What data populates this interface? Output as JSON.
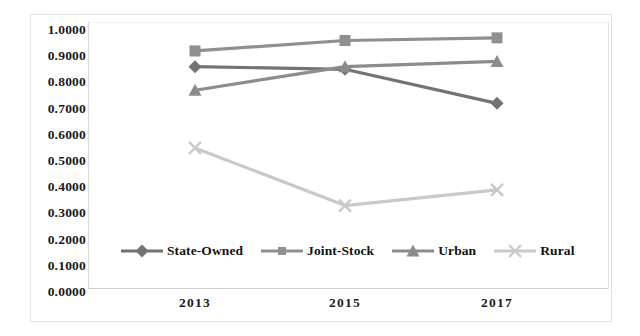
{
  "chart_data": {
    "type": "line",
    "title": "",
    "subtitle": "",
    "xlabel": "",
    "ylabel": "",
    "categories": [
      "2013",
      "2015",
      "2017"
    ],
    "x_tick_labels": [
      "2013",
      "2015",
      "2017"
    ],
    "y_tick_labels": [
      "1.0000",
      "0.9000",
      "0.8000",
      "0.7000",
      "0.6000",
      "0.5000",
      "0.4000",
      "0.3000",
      "0.2000",
      "0.1000",
      "0.0000"
    ],
    "y_tick_values": [
      1.0,
      0.9,
      0.8,
      0.7,
      0.6,
      0.5,
      0.4,
      0.3,
      0.2,
      0.1,
      0.0
    ],
    "ylim": [
      0.0,
      1.0
    ],
    "grid": false,
    "legend_position": "inside-bottom-left",
    "series": [
      {
        "name": "State-Owned",
        "marker": "diamond",
        "color": "#737373",
        "values": [
          0.86,
          0.85,
          0.72
        ]
      },
      {
        "name": "Joint-Stock",
        "marker": "square",
        "color": "#8f8f8f",
        "values": [
          0.92,
          0.96,
          0.97
        ]
      },
      {
        "name": "Urban",
        "marker": "triangle",
        "color": "#8c8c8c",
        "values": [
          0.77,
          0.86,
          0.88
        ]
      },
      {
        "name": "Rural",
        "marker": "cross",
        "color": "#c9c9c9",
        "values": [
          0.55,
          0.33,
          0.39
        ]
      }
    ]
  },
  "legend": {
    "items": [
      {
        "label": "State-Owned",
        "marker": "diamond",
        "color": "#737373"
      },
      {
        "label": "Joint-Stock",
        "marker": "square",
        "color": "#8f8f8f"
      },
      {
        "label": "Urban",
        "marker": "triangle",
        "color": "#8c8c8c"
      },
      {
        "label": "Rural",
        "marker": "cross",
        "color": "#c9c9c9"
      }
    ]
  },
  "colors": {
    "background": "#ffffff",
    "frame": "#e3e3e3",
    "plot_border": "#d9d9d9",
    "tick_text": "#1a1a1a"
  }
}
